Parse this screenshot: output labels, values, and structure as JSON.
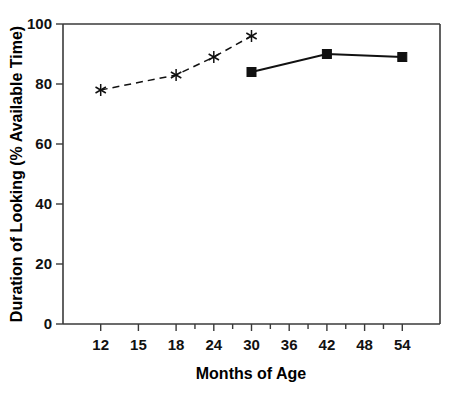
{
  "chart_data": {
    "type": "line",
    "title": "",
    "xlabel": "Months of Age",
    "ylabel": "Duration of Looking (% Available Time)",
    "xlim": [
      9,
      57
    ],
    "ylim": [
      0,
      100
    ],
    "grid": false,
    "legend_position": "none",
    "x_tick_labels": [
      "12",
      "15",
      "18",
      "24",
      "30",
      "36",
      "42",
      "48",
      "54"
    ],
    "x_tick_values": [
      12,
      15,
      18,
      24,
      30,
      36,
      42,
      48,
      54
    ],
    "y_tick_labels": [
      "0",
      "20",
      "40",
      "60",
      "80",
      "100"
    ],
    "y_tick_values": [
      0,
      20,
      40,
      60,
      80,
      100
    ],
    "series": [
      {
        "name": "dashed-star-series",
        "style": "dashed",
        "marker": "star",
        "x": [
          12,
          18,
          24,
          30
        ],
        "values": [
          78,
          83,
          89,
          96
        ]
      },
      {
        "name": "solid-square-series",
        "style": "solid",
        "marker": "filled-square",
        "x": [
          30,
          42,
          54
        ],
        "values": [
          84,
          90,
          89
        ]
      }
    ],
    "colors": {
      "line": "#111111",
      "axis": "#3a3a3a",
      "background": "#ffffff",
      "text": "#000000"
    }
  }
}
